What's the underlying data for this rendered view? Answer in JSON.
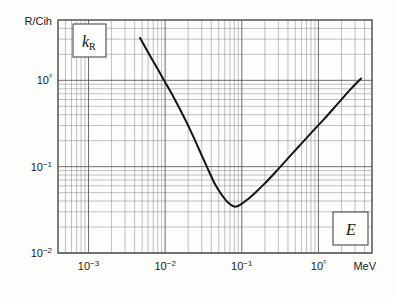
{
  "figure": {
    "yaxis_unit_label": "R/Cih",
    "xaxis_unit_label": "MeV",
    "y_symbol_main": "k",
    "y_symbol_sub": "R",
    "x_symbol": "E"
  },
  "chart_data": {
    "type": "line",
    "title": "",
    "subtitle": "",
    "xlabel": "E",
    "ylabel": "k_R",
    "x_unit": "MeV",
    "y_unit": "R/Cih",
    "xscale": "log",
    "yscale": "log",
    "xlim": [
      0.0004,
      5.0
    ],
    "ylim": [
      0.01,
      5.0
    ],
    "grid": true,
    "legend": false,
    "x_tick_labels": [
      "10−3",
      "10−2",
      "10−1",
      "10⁰"
    ],
    "x_tick_values": [
      0.001,
      0.01,
      0.1,
      1.0
    ],
    "y_tick_labels": [
      "10⁰",
      "10−1",
      "10−2"
    ],
    "y_tick_values": [
      1.0,
      0.1,
      0.01
    ],
    "series": [
      {
        "name": "k_R",
        "x": [
          0.0047,
          0.006,
          0.008,
          0.01,
          0.013,
          0.017,
          0.022,
          0.028,
          0.035,
          0.045,
          0.055,
          0.065,
          0.08,
          0.095,
          0.12,
          0.15,
          0.2,
          0.28,
          0.4,
          0.55,
          0.8,
          1.2,
          1.8,
          2.6,
          3.6
        ],
        "y": [
          3.1,
          2.1,
          1.35,
          0.95,
          0.63,
          0.4,
          0.25,
          0.155,
          0.1,
          0.062,
          0.047,
          0.039,
          0.0345,
          0.036,
          0.042,
          0.05,
          0.064,
          0.088,
          0.125,
          0.17,
          0.245,
          0.36,
          0.54,
          0.78,
          1.05
        ]
      }
    ],
    "annotations": [
      {
        "name": "y-axis-symbol-box",
        "text": "k_R"
      },
      {
        "name": "x-axis-symbol-box",
        "text": "E"
      }
    ],
    "minimum": {
      "x": 0.08,
      "y": 0.035
    }
  }
}
